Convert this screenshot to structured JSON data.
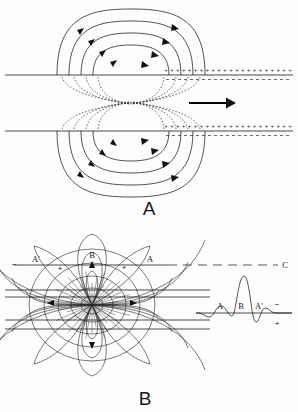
{
  "figure": {
    "background_color": "#fdfdfd",
    "ink_color": "#1a1a1a"
  },
  "panels": [
    {
      "id": "panel-a",
      "letter": "A",
      "description": "Two parallel membrane lines with nested closed field-line loops above and below, dashed field lines pinching at the center, positive charges to the right of the depolarization front, and a bold arrow showing propagation direction.",
      "propagation_arrow": {
        "direction": "right",
        "x1": 189,
        "x2": 231,
        "y": 103
      },
      "membrane_lines": [
        {
          "y": 75,
          "x1": 5,
          "x2": 293
        },
        {
          "y": 131,
          "x1": 5,
          "x2": 293
        }
      ],
      "charge_symbol": "+",
      "charge_symbol_negative": "-",
      "charge_rows": [
        {
          "y_plus": 71.5,
          "y_minus": 79,
          "x_start": 166,
          "x_end": 290,
          "count": 22
        },
        {
          "y_plus": 127.5,
          "y_minus": 135,
          "x_start": 166,
          "x_end": 290,
          "count": 22
        }
      ],
      "loops_above": [
        {
          "rx": 74,
          "ry": 66,
          "cx": 131
        },
        {
          "rx": 62,
          "ry": 54,
          "cx": 131
        },
        {
          "rx": 50,
          "ry": 42,
          "cx": 131
        },
        {
          "rx": 38,
          "ry": 30,
          "cx": 131
        }
      ],
      "loops_below": [
        {
          "rx": 74,
          "ry": 66,
          "cx": 131
        },
        {
          "rx": 62,
          "ry": 54,
          "cx": 131
        },
        {
          "rx": 50,
          "ry": 42,
          "cx": 131
        },
        {
          "rx": 38,
          "ry": 30,
          "cx": 131
        }
      ]
    },
    {
      "id": "panel-b",
      "letter": "B",
      "description": "A dipole field with radial lines emanating from a central source, crossed by four horizontal recording lines, a dashed lead line C, and a derived triphasic waveform.",
      "dipole_center": {
        "x": 92,
        "y": 305
      },
      "lead_line": {
        "label": "C",
        "label_x": 285,
        "y": 265,
        "x1": 14,
        "x2": 278
      },
      "recording_lines": [
        {
          "y": 290,
          "x1": 5,
          "x2": 210
        },
        {
          "y": 297,
          "x1": 5,
          "x2": 210
        },
        {
          "y": 320,
          "x1": 5,
          "x2": 210
        },
        {
          "y": 329,
          "x1": 5,
          "x2": 210
        }
      ],
      "field_labels": [
        {
          "text": "A′",
          "x": 36,
          "y": 262
        },
        {
          "text": "B",
          "x": 92,
          "y": 258
        },
        {
          "text": "A",
          "x": 150,
          "y": 262
        }
      ],
      "charge_marks": [
        {
          "text": "−",
          "x": 14,
          "y": 266
        },
        {
          "text": "+",
          "x": 60,
          "y": 270
        },
        {
          "text": "+",
          "x": 124,
          "y": 269
        },
        {
          "text": "−",
          "x": 93,
          "y": 266
        }
      ],
      "waveform": {
        "baseline_y": 313,
        "x_start": 196,
        "x_end": 292,
        "labels": [
          {
            "text": "A",
            "x": 220,
            "y": 308
          },
          {
            "text": "B",
            "x": 241,
            "y": 308
          },
          {
            "text": "A′",
            "x": 259,
            "y": 308
          }
        ],
        "polarity": {
          "negative": {
            "text": "−",
            "x": 277,
            "y": 306
          },
          "positive": {
            "text": "+",
            "x": 277,
            "y": 324
          }
        }
      }
    }
  ]
}
